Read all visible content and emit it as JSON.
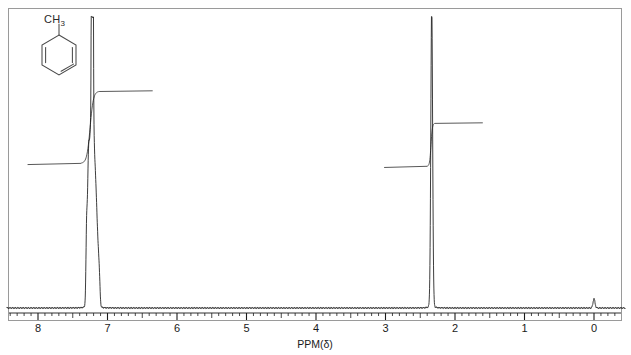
{
  "figure": {
    "kind": "nmr-spectrum",
    "structure_label": "CH",
    "structure_label_sub": "3",
    "structure_name": "toluene-skeletal-structure"
  },
  "axis": {
    "title": "PPM(δ)",
    "tick_labels": [
      "8",
      "7",
      "6",
      "5",
      "4",
      "3",
      "2",
      "1",
      "0"
    ],
    "direction": "8-to-0-left-to-right",
    "minor_tick_step": 0.1,
    "colors": {
      "frame": "#9a9a9a",
      "trace": "#1a1a1a",
      "integral": "#3a3a3a"
    }
  },
  "chart_data": {
    "type": "line",
    "title": "",
    "xlabel": "PPM(δ)",
    "ylabel": "",
    "xlim": [
      8.45,
      -0.45
    ],
    "ylim": [
      0,
      1
    ],
    "grid": false,
    "legend": "none",
    "x_tick_values": [
      8,
      7,
      6,
      5,
      4,
      3,
      2,
      1,
      0
    ],
    "series": [
      {
        "name": "spectrum",
        "kind": "nmr-trace",
        "peaks": [
          {
            "ppm": 7.3,
            "height": 0.255,
            "width": 0.01,
            "label": "aromatic-H"
          },
          {
            "ppm": 7.28,
            "height": 0.3,
            "width": 0.01,
            "label": "aromatic-H"
          },
          {
            "ppm": 7.265,
            "height": 0.36,
            "width": 0.01,
            "label": "aromatic-H"
          },
          {
            "ppm": 7.25,
            "height": 0.3,
            "width": 0.009,
            "label": "aromatic-H"
          },
          {
            "ppm": 7.235,
            "height": 0.415,
            "width": 0.01,
            "label": "aromatic-H"
          },
          {
            "ppm": 7.222,
            "height": 0.48,
            "width": 0.01,
            "label": "aromatic-H"
          },
          {
            "ppm": 7.205,
            "height": 0.415,
            "width": 0.01,
            "label": "aromatic-H"
          },
          {
            "ppm": 7.19,
            "height": 0.3,
            "width": 0.01,
            "label": "aromatic-H"
          },
          {
            "ppm": 7.175,
            "height": 0.27,
            "width": 0.01,
            "label": "aromatic-H"
          },
          {
            "ppm": 7.16,
            "height": 0.215,
            "width": 0.01,
            "label": "aromatic-H"
          },
          {
            "ppm": 7.145,
            "height": 0.15,
            "width": 0.01,
            "label": "aromatic-H"
          },
          {
            "ppm": 7.13,
            "height": 0.11,
            "width": 0.01,
            "label": "aromatic-H"
          },
          {
            "ppm": 7.115,
            "height": 0.075,
            "width": 0.01,
            "label": "aromatic-H"
          },
          {
            "ppm": 7.21,
            "height": 0.9,
            "width": 0.006,
            "label": "aromatic-tall"
          },
          {
            "ppm": 7.228,
            "height": 0.7,
            "width": 0.005,
            "label": "aromatic-tall"
          },
          {
            "ppm": 2.335,
            "height": 0.985,
            "width": 0.013,
            "label": "methyl-CH3"
          },
          {
            "ppm": 0.0,
            "height": 0.03,
            "width": 0.014,
            "label": "TMS"
          }
        ]
      },
      {
        "name": "integral-aromatic",
        "kind": "integral-step",
        "start_ppm": 8.15,
        "rise_start_ppm": 7.38,
        "rise_end_ppm": 7.12,
        "end_ppm": 6.35,
        "baseline_level": 0.497,
        "plateau_level": 0.745,
        "relative_area": 5
      },
      {
        "name": "integral-methyl",
        "kind": "integral-step",
        "start_ppm": 3.02,
        "rise_start_ppm": 2.4,
        "rise_end_ppm": 2.29,
        "end_ppm": 1.6,
        "baseline_level": 0.487,
        "plateau_level": 0.635,
        "relative_area": 3
      }
    ]
  }
}
